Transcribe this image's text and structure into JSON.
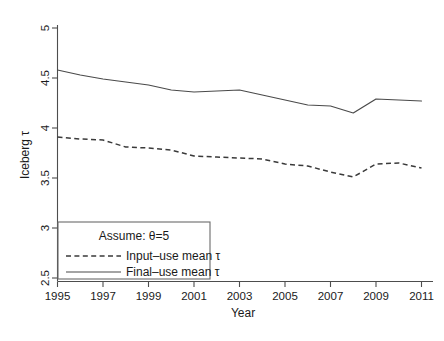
{
  "chart_data": {
    "type": "line",
    "title": "",
    "xlabel": "Year",
    "ylabel": "Iceberg τ",
    "xlim": [
      1995,
      2011
    ],
    "ylim": [
      2.5,
      5
    ],
    "grid": false,
    "legend_position": "bottom-left",
    "annotation": "Assume: θ=5",
    "x": [
      1995,
      1996,
      1997,
      1998,
      1999,
      2000,
      2001,
      2002,
      2003,
      2004,
      2005,
      2006,
      2007,
      2008,
      2009,
      2010,
      2011
    ],
    "xticks": [
      "1995",
      "1997",
      "1999",
      "2001",
      "2003",
      "2005",
      "2007",
      "2009",
      "2011"
    ],
    "xtick_values": [
      1995,
      1997,
      1999,
      2001,
      2003,
      2005,
      2007,
      2009,
      2011
    ],
    "yticks": [
      "2.5",
      "3",
      "3.5",
      "4",
      "4.5",
      "5"
    ],
    "ytick_values": [
      2.5,
      3,
      3.5,
      4,
      4.5,
      5
    ],
    "series": [
      {
        "name": "Input–use mean τ",
        "style": "dashed",
        "color": "#3a3a3a",
        "values": [
          3.91,
          3.89,
          3.88,
          3.81,
          3.8,
          3.78,
          3.72,
          3.71,
          3.7,
          3.69,
          3.64,
          3.62,
          3.56,
          3.51,
          3.64,
          3.65,
          3.6
        ]
      },
      {
        "name": "Final–use mean τ",
        "style": "solid",
        "color": "#4a4a4a",
        "values": [
          4.58,
          4.53,
          4.49,
          4.46,
          4.43,
          4.38,
          4.36,
          4.37,
          4.38,
          4.33,
          4.28,
          4.23,
          4.22,
          4.15,
          4.29,
          4.28,
          4.27
        ]
      }
    ]
  },
  "legend": {
    "title": "Assume: θ=5",
    "items": [
      {
        "label": "Input–use mean τ",
        "style": "dashed"
      },
      {
        "label": "Final–use mean τ",
        "style": "solid"
      }
    ]
  },
  "axes": {
    "x_title": "Year",
    "y_title": "Iceberg τ"
  }
}
